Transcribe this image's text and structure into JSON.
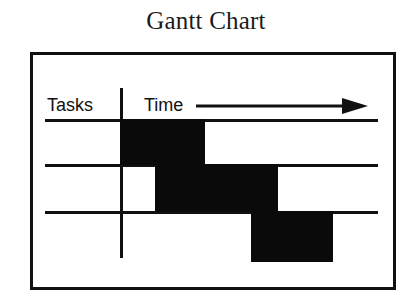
{
  "title": "Gantt Chart",
  "axes": {
    "tasks_label": "Tasks",
    "time_label": "Time",
    "arrow_icon": "right-arrow-icon"
  },
  "colors": {
    "bar": "#0a0a0a",
    "frame": "#111111",
    "rule": "#111111",
    "background": "#ffffff",
    "title": "#1a1a1a"
  },
  "chart_data": {
    "type": "bar",
    "title": "Gantt Chart",
    "xlabel": "Time",
    "ylabel": "Tasks",
    "orientation": "horizontal",
    "grid": true,
    "legend": false,
    "axis_style": "unlabeled-schematic",
    "xlim": [
      0,
      100
    ],
    "categories": [
      "Task 1",
      "Task 2",
      "Task 3"
    ],
    "bars": [
      {
        "row": 1,
        "start": 0,
        "end": 32,
        "label": ""
      },
      {
        "row": 2,
        "start": 13,
        "end": 61,
        "label": ""
      },
      {
        "row": 3,
        "start": 50,
        "end": 82,
        "label": ""
      }
    ],
    "tick_labels": {
      "x": [],
      "y": []
    },
    "annotations": [
      {
        "text": "Tasks",
        "position": "left-header"
      },
      {
        "text": "Time",
        "position": "top-right-header"
      }
    ]
  },
  "geometry": {
    "frame": {
      "x": 30,
      "y": 52,
      "w": 366,
      "h": 238
    },
    "rules_y": [
      119,
      164,
      211
    ],
    "divider_x": 120,
    "bars_px": [
      {
        "x": 120,
        "y": 119,
        "w": 85,
        "h": 46
      },
      {
        "x": 155,
        "y": 164,
        "w": 123,
        "h": 48
      },
      {
        "x": 251,
        "y": 211,
        "w": 82,
        "h": 51
      }
    ]
  }
}
